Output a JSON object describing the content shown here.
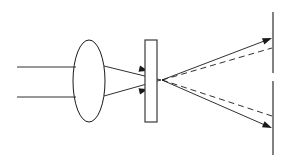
{
  "figure": {
    "type": "line-diagram",
    "canvas": {
      "width": 291,
      "height": 163,
      "background": "#ffffff"
    },
    "stroke_color": "#1a1a1a",
    "aperture_stroke_color": "#3a3a3a"
  },
  "elements": {
    "incoming_rays": {
      "name": "incoming-parallel-rays",
      "count": 2,
      "style": "solid",
      "lines": [
        {
          "x1": 17,
          "y1": 67,
          "x2": 76,
          "y2": 67
        },
        {
          "x1": 17,
          "y1": 97,
          "x2": 76,
          "y2": 97
        }
      ]
    },
    "lens": {
      "name": "converging-lens",
      "shape": "ellipse",
      "cx": 89,
      "cy": 81,
      "rx": 16,
      "ry": 41
    },
    "converging_rays": {
      "name": "converging-rays",
      "count": 2,
      "style": "solid",
      "lines": [
        {
          "x1": 104,
          "y1": 66,
          "x2": 161,
          "y2": 80
        },
        {
          "x1": 104,
          "y1": 96,
          "x2": 161,
          "y2": 80
        }
      ],
      "arrow_heads": [
        {
          "x": 146,
          "y": 70,
          "angle": 13.8
        },
        {
          "x": 146,
          "y": 90,
          "angle": -13.8
        }
      ]
    },
    "aperture": {
      "name": "aperture-slit",
      "shape": "rectangle",
      "x": 145,
      "y": 40,
      "width": 12,
      "height": 82
    },
    "focal_point": {
      "x": 162,
      "y": 80
    },
    "diverging_solid_rays": {
      "name": "diverging-solid-rays",
      "count": 2,
      "style": "solid",
      "lines": [
        {
          "x1": 162,
          "y1": 80,
          "x2": 272,
          "y2": 38
        },
        {
          "x1": 162,
          "y1": 80,
          "x2": 272,
          "y2": 128
        }
      ],
      "arrow_heads": [
        {
          "x": 272,
          "y": 38,
          "angle": -20.9
        },
        {
          "x": 272,
          "y": 128,
          "angle": 23.6
        }
      ]
    },
    "diverging_dashed_rays": {
      "name": "diverging-dashed-rays",
      "count": 2,
      "style": "dashed",
      "dash_pattern": "6 4",
      "lines": [
        {
          "x1": 162,
          "y1": 80,
          "x2": 272,
          "y2": 48
        },
        {
          "x1": 162,
          "y1": 80,
          "x2": 272,
          "y2": 116
        }
      ]
    },
    "screen": {
      "name": "projection-screen",
      "shape": "vertical-line-with-gap",
      "x": 273,
      "segments": [
        {
          "y1": 12,
          "y2": 73
        },
        {
          "y1": 81,
          "y2": 155
        }
      ],
      "gap": {
        "y1": 73,
        "y2": 81
      }
    }
  }
}
